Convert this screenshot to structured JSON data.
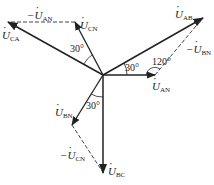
{
  "diagram": {
    "type": "phasor-diagram",
    "origin": [
      103,
      75
    ],
    "colors": {
      "line": "#222222",
      "dashed": "#444444",
      "background": "#ffffff"
    },
    "phasors": [
      {
        "id": "U_AN",
        "label_main": "U",
        "label_sub": "AN",
        "prefix": "",
        "tip": [
          155,
          75
        ],
        "style": "solid"
      },
      {
        "id": "U_BN",
        "label_main": "U",
        "label_sub": "BN",
        "prefix": "",
        "tip": [
          72,
          125
        ],
        "style": "solid"
      },
      {
        "id": "U_CN",
        "label_main": "U",
        "label_sub": "CN",
        "prefix": "",
        "tip": [
          75,
          22
        ],
        "style": "solid"
      },
      {
        "id": "U_AB",
        "label_main": "U",
        "label_sub": "AB",
        "prefix": "",
        "tip": [
          203,
          18
        ],
        "style": "solid"
      },
      {
        "id": "U_BC",
        "label_main": "U",
        "label_sub": "BC",
        "prefix": "",
        "tip": [
          103,
          173
        ],
        "style": "solid"
      },
      {
        "id": "U_CA",
        "label_main": "U",
        "label_sub": "CA",
        "prefix": "",
        "tip": [
          8,
          22
        ],
        "style": "solid"
      }
    ],
    "dashed_vectors": [
      {
        "id": "neg_U_AN",
        "label_main": "U",
        "label_sub": "AN",
        "prefix": "−",
        "from": [
          75,
          22
        ],
        "to": [
          8,
          22
        ]
      },
      {
        "id": "neg_U_BN",
        "label_main": "U",
        "label_sub": "BN",
        "prefix": "−",
        "from": [
          155,
          75
        ],
        "to": [
          203,
          18
        ]
      },
      {
        "id": "neg_U_CN",
        "label_main": "U",
        "label_sub": "CN",
        "prefix": "−",
        "from": [
          72,
          125
        ],
        "to": [
          103,
          173
        ]
      }
    ],
    "angles": [
      {
        "id": "angle_CA_CN",
        "text": "30°"
      },
      {
        "id": "angle_AN_AB",
        "text": "30°"
      },
      {
        "id": "angle_AN_negBN",
        "text": "120°"
      },
      {
        "id": "angle_BN_BC",
        "text": "30°"
      }
    ]
  }
}
